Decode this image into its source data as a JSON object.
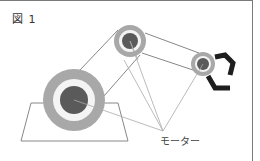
{
  "figure": {
    "label": "図 1",
    "motor_label": "モーター"
  },
  "colors": {
    "outer_ring": "#a8a8a8",
    "white_ring": "#f4f4f4",
    "core": "#5a5a5a",
    "gripper": "#1e1e1e",
    "line": "#888888",
    "leader": "#aaaaaa",
    "frame": "#7a7a7a"
  },
  "joints": [
    {
      "name": "base-joint",
      "cx": 74,
      "cy": 100,
      "r_outer": 31,
      "r_white": 21,
      "r_core": 14
    },
    {
      "name": "elbow-joint",
      "cx": 130,
      "cy": 41,
      "r_outer": 16,
      "r_white": 11,
      "r_core": 8
    },
    {
      "name": "wrist-joint",
      "cx": 203,
      "cy": 64,
      "r_outer": 12,
      "r_white": 8,
      "r_core": 6
    }
  ],
  "leader_target": {
    "x": 163,
    "y": 131
  }
}
